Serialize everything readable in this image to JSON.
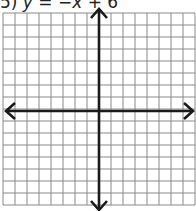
{
  "problem": {
    "number": "5)",
    "equation": "y = −x + 6",
    "equation_parts": {
      "lhs": "y",
      "equals": "=",
      "rhs_term1": "−x",
      "plus": "+",
      "rhs_constant": "6"
    }
  },
  "graph": {
    "type": "coordinate-grid",
    "columns": 16,
    "rows": 16,
    "cell_size_px": 12,
    "origin_col": 8,
    "origin_row": 8,
    "grid_color": "#8a8a8a",
    "axis_color": "#1a1a1a",
    "axes": {
      "x_arrows": [
        "left",
        "right"
      ],
      "y_arrows": [
        "up",
        "down"
      ]
    }
  }
}
